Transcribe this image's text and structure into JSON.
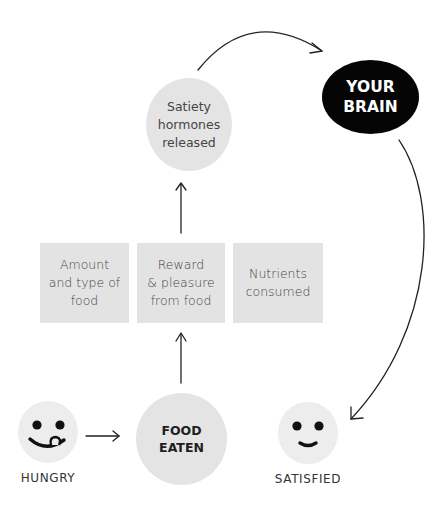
{
  "diagram": {
    "nodes": {
      "satiety": "Satiety\nhormones\nreleased",
      "brain": "YOUR\nBRAIN",
      "food_eaten": "FOOD\nEATEN",
      "factors": [
        "Amount\nand type of\nfood",
        "Reward\n& pleasure\nfrom food",
        "Nutrients\nconsumed"
      ],
      "hungry_label": "HUNGRY",
      "satisfied_label": "SATISFIED"
    },
    "icons": {
      "hungry_face": "hungry-face-tongue-icon",
      "satisfied_face": "satisfied-smile-face-icon"
    },
    "colors": {
      "node_fill": "#e4e4e4",
      "brain_fill": "#050505",
      "arrow": "#222222"
    },
    "flow": [
      "HUNGRY -> FOOD EATEN",
      "FOOD EATEN -> Reward & pleasure from food",
      "Reward & pleasure from food -> Satiety hormones released",
      "Satiety hormones released -> YOUR BRAIN",
      "YOUR BRAIN -> SATISFIED"
    ]
  }
}
